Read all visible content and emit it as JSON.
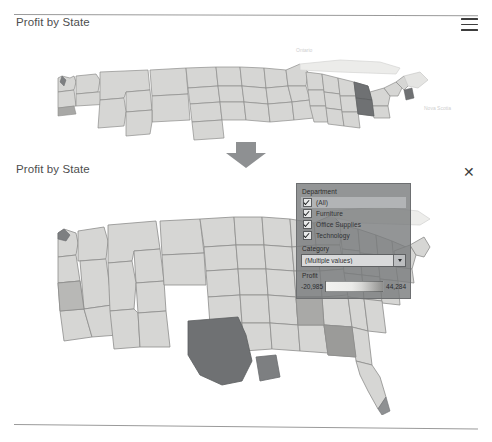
{
  "document": {
    "title": "Profit by State"
  },
  "views": [
    {
      "id": "view-unfiltered",
      "title": "Profit by State",
      "menu_icon": "hamburger-menu-icon",
      "highlighted_states": [
        "New York"
      ]
    },
    {
      "id": "view-filtered",
      "title": "Profit by State",
      "close_icon": "close-icon",
      "highlighted_states": [
        "Texas"
      ]
    }
  ],
  "annotation": {
    "icon": "down-arrow-icon",
    "direction": "down"
  },
  "filter_panel": {
    "department": {
      "label": "Department",
      "items": [
        {
          "label": "(All)",
          "checked": true,
          "selected": true
        },
        {
          "label": "Furniture",
          "checked": true,
          "selected": false
        },
        {
          "label": "Office Supplies",
          "checked": true,
          "selected": false
        },
        {
          "label": "Technology",
          "checked": true,
          "selected": false
        }
      ]
    },
    "category": {
      "label": "Category",
      "value": "(Multiple values)",
      "caret_icon": "chevron-down-icon"
    },
    "profit_legend": {
      "label": "Profit",
      "min": "-20,985",
      "max": "44,284",
      "ramp_low_color": "#f2f2f0",
      "ramp_high_color": "#8e8e8c"
    }
  },
  "map_labels": {
    "ontario": "Ontario",
    "nova_scotia": "Nova Scotia"
  },
  "colors": {
    "state_fill": "#d6d6d4",
    "state_stroke": "#8d8d8b",
    "state_highlight": "#6f7173",
    "panel_bg": "#787a7c",
    "page_bg": "#ffffff",
    "text": "#4a4a4a"
  }
}
